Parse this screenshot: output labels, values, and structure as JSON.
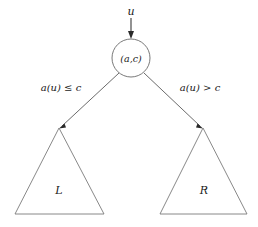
{
  "diagram": {
    "background_color": "#ffffff",
    "line_color": "#5a5a5a",
    "text_color": "#1a1a1a",
    "incoming": {
      "label": "u",
      "arrow_direction": "down"
    },
    "root_node": {
      "label": "(a,c)",
      "label_open": "(",
      "label_a": "a",
      "label_comma": ",",
      "label_c": "c",
      "label_close": ")",
      "shape": "circle",
      "center_x": 131,
      "center_y": 58,
      "radius": 19
    },
    "edges": [
      {
        "id": "left-edge",
        "label": "a(u) ≤ c",
        "label_fn": "a",
        "label_arg_open": "(",
        "label_arg": "u",
        "label_arg_close": ")",
        "label_op": "≤",
        "label_rhs": "c",
        "from_x": 119,
        "from_y": 73,
        "to_x": 59,
        "to_y": 128
      },
      {
        "id": "right-edge",
        "label": "a(u) > c",
        "label_fn": "a",
        "label_arg_open": "(",
        "label_arg": "u",
        "label_arg_close": ")",
        "label_op": ">",
        "label_rhs": "c",
        "from_x": 144,
        "from_y": 73,
        "to_x": 203,
        "to_y": 128
      }
    ],
    "subtrees": [
      {
        "id": "left-subtree",
        "label": "L",
        "apex_x": 59,
        "apex_y": 128,
        "base_left_x": 15,
        "base_right_x": 104,
        "base_y": 214,
        "label_x": 59,
        "label_y": 191
      },
      {
        "id": "right-subtree",
        "label": "R",
        "apex_x": 203,
        "apex_y": 128,
        "base_left_x": 160,
        "base_right_x": 247,
        "base_y": 214,
        "label_x": 204,
        "label_y": 191
      }
    ]
  }
}
